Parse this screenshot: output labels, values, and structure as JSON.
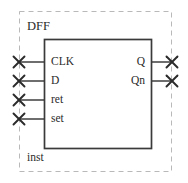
{
  "diagram": {
    "type": "schematic-symbol",
    "block_label": "DFF",
    "instance_label": "inst",
    "colors": {
      "boundary": "#b9b9b9",
      "symbol_outline": "#3a3a3a",
      "wire": "#4a4a4a",
      "terminal": "#2b2b2b",
      "text": "#2b2b2b",
      "background": "#ffffff"
    },
    "boundary": {
      "style": "dashed",
      "x": 19,
      "y": 11,
      "width": 153,
      "height": 161
    },
    "symbol_box": {
      "style": "solid",
      "x": 44,
      "y": 39,
      "width": 108,
      "height": 110
    },
    "inputs": [
      {
        "name": "CLK",
        "y": 62,
        "terminal_x": 19,
        "wire_to_x": 44,
        "has_terminal": true,
        "terminal_glyph": "x-terminal"
      },
      {
        "name": "D",
        "y": 81,
        "terminal_x": 19,
        "wire_to_x": 44,
        "has_terminal": true,
        "terminal_glyph": "x-terminal"
      },
      {
        "name": "ret",
        "y": 100,
        "terminal_x": 19,
        "wire_to_x": 44,
        "has_terminal": true,
        "terminal_glyph": "x-terminal"
      },
      {
        "name": "set",
        "y": 119,
        "terminal_x": 19,
        "wire_to_x": 44,
        "has_terminal": true,
        "terminal_glyph": "x-terminal"
      }
    ],
    "outputs": [
      {
        "name": "Q",
        "y": 62,
        "terminal_x": 172,
        "wire_from_x": 152,
        "has_terminal": true,
        "terminal_glyph": "x-terminal"
      },
      {
        "name": "Qn",
        "y": 81,
        "terminal_x": 172,
        "wire_from_x": 152,
        "has_terminal": true,
        "terminal_glyph": "x-terminal"
      }
    ]
  }
}
